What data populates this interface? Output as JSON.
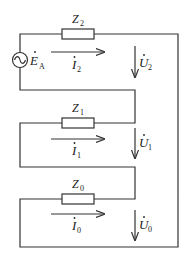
{
  "diagram": {
    "type": "circuit",
    "source": {
      "label": "E",
      "sub": "A",
      "dot": true,
      "symbol": "ac-voltage-source"
    },
    "branches": [
      {
        "impedance": {
          "label": "Z",
          "sub": "2"
        },
        "current": {
          "label": "I",
          "sub": "2"
        },
        "voltage": {
          "label": "U",
          "sub": "2"
        }
      },
      {
        "impedance": {
          "label": "Z",
          "sub": "1"
        },
        "current": {
          "label": "I",
          "sub": "1"
        },
        "voltage": {
          "label": "U",
          "sub": "1"
        }
      },
      {
        "impedance": {
          "label": "Z",
          "sub": "0"
        },
        "current": {
          "label": "I",
          "sub": "0"
        },
        "voltage": {
          "label": "U",
          "sub": "0"
        }
      }
    ],
    "colors": {
      "stroke": "#333333",
      "text": "#222222",
      "background": "#ffffff"
    }
  }
}
